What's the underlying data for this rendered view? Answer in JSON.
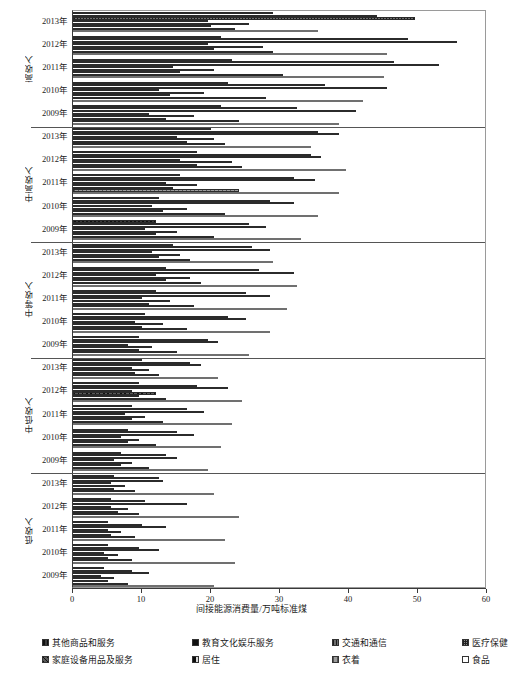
{
  "chart_data": {
    "type": "bar",
    "orientation": "horizontal",
    "title": "",
    "xlabel": "间接能源消费量/万吨标准煤",
    "ylabel": "",
    "xlim": [
      0,
      60
    ],
    "xticks": [
      0,
      10,
      20,
      30,
      40,
      50,
      60
    ],
    "grid": false,
    "legend_position": "bottom",
    "series": [
      {
        "name": "其他商品和服务",
        "key": "other",
        "pattern": "checker-dark"
      },
      {
        "name": "教育文化娱乐服务",
        "key": "edu",
        "pattern": "solid-black"
      },
      {
        "name": "交通和通信",
        "key": "trans",
        "pattern": "dotted-grey"
      },
      {
        "name": "医疗保健",
        "key": "med",
        "pattern": "crosshatch-grey"
      },
      {
        "name": "家庭设备用品及服务",
        "key": "house",
        "pattern": "diagonal-hatch"
      },
      {
        "name": "居住",
        "key": "live",
        "pattern": "dashed-dark"
      },
      {
        "name": "衣着",
        "key": "cloth",
        "pattern": "grey-fine"
      },
      {
        "name": "食品",
        "key": "food",
        "pattern": "hollow-white"
      }
    ],
    "groups": [
      {
        "name": "高收入",
        "years": [
          {
            "year": "2013年",
            "values": {
              "other": 29.0,
              "edu": 44.0,
              "trans": 49.5,
              "med": 19.5,
              "house": 25.5,
              "live": 20.0,
              "cloth": 23.5,
              "food": 35.5
            }
          },
          {
            "year": "2012年",
            "values": {
              "other": 21.5,
              "edu": 48.5,
              "trans": 55.7,
              "med": 19.5,
              "house": 27.5,
              "live": 20.5,
              "cloth": 29.0,
              "food": 45.5
            }
          },
          {
            "year": "2011年",
            "values": {
              "other": 23.0,
              "edu": 46.5,
              "trans": 53.0,
              "med": 14.5,
              "house": 20.5,
              "live": 15.5,
              "cloth": 30.5,
              "food": 45.0
            }
          },
          {
            "year": "2010年",
            "values": {
              "other": 22.5,
              "edu": 36.5,
              "trans": 45.5,
              "med": 12.5,
              "house": 19.0,
              "live": 14.0,
              "cloth": 28.0,
              "food": 42.0
            }
          },
          {
            "year": "2009年",
            "values": {
              "other": 21.5,
              "edu": 32.5,
              "trans": 41.0,
              "med": 11.0,
              "house": 17.5,
              "live": 13.5,
              "cloth": 24.0,
              "food": 38.5
            }
          }
        ]
      },
      {
        "name": "中高收入",
        "years": [
          {
            "year": "2013年",
            "values": {
              "other": 20.0,
              "edu": 35.5,
              "trans": 38.5,
              "med": 15.0,
              "house": 20.5,
              "live": 16.5,
              "cloth": 22.0,
              "food": 34.5
            }
          },
          {
            "year": "2012年",
            "values": {
              "other": 18.0,
              "edu": 34.5,
              "trans": 36.0,
              "med": 15.5,
              "house": 23.0,
              "live": 18.0,
              "cloth": 24.5,
              "food": 39.5
            }
          },
          {
            "year": "2011年",
            "values": {
              "other": 15.5,
              "edu": 32.0,
              "trans": 35.0,
              "med": 13.5,
              "house": 18.0,
              "live": 14.5,
              "cloth": 24.0,
              "food": 38.5
            }
          },
          {
            "year": "2010年",
            "values": {
              "other": 12.5,
              "edu": 28.5,
              "trans": 32.0,
              "med": 11.5,
              "house": 16.5,
              "live": 13.0,
              "cloth": 22.0,
              "food": 35.5
            }
          },
          {
            "year": "2009年",
            "values": {
              "other": 12.0,
              "edu": 25.5,
              "trans": 28.0,
              "med": 10.5,
              "house": 15.0,
              "live": 12.0,
              "cloth": 20.5,
              "food": 33.0
            }
          }
        ]
      },
      {
        "name": "中等收入",
        "years": [
          {
            "year": "2013年",
            "values": {
              "other": 14.5,
              "edu": 26.0,
              "trans": 28.5,
              "med": 11.5,
              "house": 15.5,
              "live": 12.5,
              "cloth": 17.0,
              "food": 29.0
            }
          },
          {
            "year": "2012年",
            "values": {
              "other": 13.5,
              "edu": 27.0,
              "trans": 32.0,
              "med": 12.0,
              "house": 17.0,
              "live": 13.5,
              "cloth": 18.5,
              "food": 32.5
            }
          },
          {
            "year": "2011年",
            "values": {
              "other": 12.0,
              "edu": 25.0,
              "trans": 28.5,
              "med": 10.0,
              "house": 14.0,
              "live": 11.0,
              "cloth": 17.5,
              "food": 31.0
            }
          },
          {
            "year": "2010年",
            "values": {
              "other": 10.5,
              "edu": 22.5,
              "trans": 25.0,
              "med": 9.0,
              "house": 13.0,
              "live": 10.0,
              "cloth": 16.5,
              "food": 28.5
            }
          },
          {
            "year": "2009年",
            "values": {
              "other": 9.5,
              "edu": 19.5,
              "trans": 21.0,
              "med": 8.0,
              "house": 11.5,
              "live": 9.5,
              "cloth": 15.0,
              "food": 25.5
            }
          }
        ]
      },
      {
        "name": "中低收入",
        "years": [
          {
            "year": "2013年",
            "values": {
              "other": 10.0,
              "edu": 17.0,
              "trans": 18.5,
              "med": 8.5,
              "house": 11.0,
              "live": 9.0,
              "cloth": 12.5,
              "food": 21.0
            }
          },
          {
            "year": "2012年",
            "values": {
              "other": 9.5,
              "edu": 18.0,
              "trans": 22.5,
              "med": 8.5,
              "house": 12.0,
              "live": 9.5,
              "cloth": 13.5,
              "food": 24.5
            }
          },
          {
            "year": "2011年",
            "values": {
              "other": 8.5,
              "edu": 16.5,
              "trans": 19.0,
              "med": 7.5,
              "house": 10.5,
              "live": 8.5,
              "cloth": 13.0,
              "food": 23.0
            }
          },
          {
            "year": "2010年",
            "values": {
              "other": 8.0,
              "edu": 15.0,
              "trans": 17.5,
              "med": 7.0,
              "house": 9.5,
              "live": 8.0,
              "cloth": 12.0,
              "food": 21.5
            }
          },
          {
            "year": "2009年",
            "values": {
              "other": 7.0,
              "edu": 13.5,
              "trans": 15.0,
              "med": 6.0,
              "house": 8.5,
              "live": 7.0,
              "cloth": 11.0,
              "food": 19.5
            }
          }
        ]
      },
      {
        "name": "低收入",
        "years": [
          {
            "year": "2013年",
            "values": {
              "other": 6.0,
              "edu": 12.5,
              "trans": 13.0,
              "med": 5.5,
              "house": 7.5,
              "live": 6.0,
              "cloth": 9.0,
              "food": 20.5
            }
          },
          {
            "year": "2012年",
            "values": {
              "other": 5.5,
              "edu": 10.5,
              "trans": 16.5,
              "med": 5.5,
              "house": 8.0,
              "live": 6.5,
              "cloth": 9.5,
              "food": 24.0
            }
          },
          {
            "year": "2011年",
            "values": {
              "other": 5.0,
              "edu": 10.0,
              "trans": 13.5,
              "med": 5.0,
              "house": 7.0,
              "live": 5.5,
              "cloth": 9.0,
              "food": 22.0
            }
          },
          {
            "year": "2010年",
            "values": {
              "other": 5.0,
              "edu": 9.5,
              "trans": 12.5,
              "med": 4.5,
              "house": 6.5,
              "live": 5.0,
              "cloth": 8.5,
              "food": 23.5
            }
          },
          {
            "year": "2009年",
            "values": {
              "other": 4.5,
              "edu": 8.5,
              "trans": 11.0,
              "med": 4.0,
              "house": 6.0,
              "live": 5.0,
              "cloth": 8.0,
              "food": 20.5
            }
          }
        ]
      }
    ]
  },
  "axis": {
    "x_title": "间接能源消费量/万吨标准煤",
    "tick_labels": [
      "0",
      "10",
      "20",
      "30",
      "40",
      "50",
      "60"
    ]
  },
  "legend": {
    "items": [
      {
        "label": "其他商品和服务",
        "key": "other"
      },
      {
        "label": "教育文化娱乐服务",
        "key": "edu"
      },
      {
        "label": "交通和通信",
        "key": "trans"
      },
      {
        "label": "医疗保健",
        "key": "med"
      },
      {
        "label": "家庭设备用品及服务",
        "key": "house"
      },
      {
        "label": "居住",
        "key": "live"
      },
      {
        "label": "衣着",
        "key": "cloth"
      },
      {
        "label": "食品",
        "key": "food"
      }
    ]
  }
}
